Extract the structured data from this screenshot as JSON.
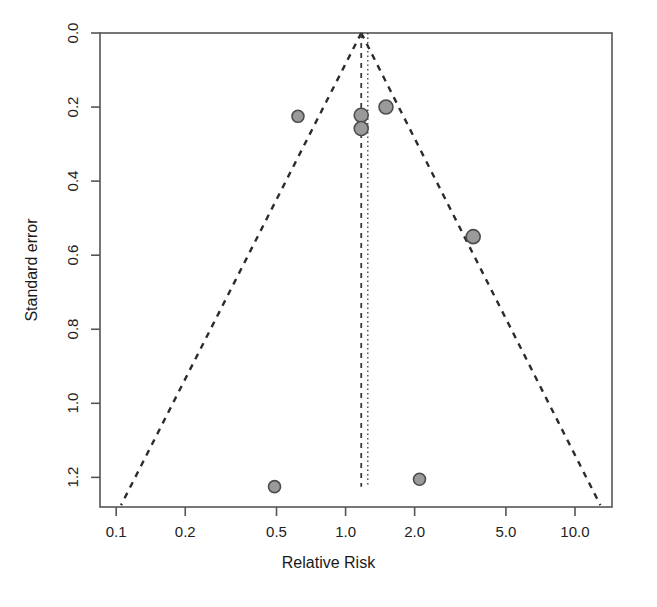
{
  "chart_data": {
    "type": "scatter",
    "title": "",
    "subtitle": "",
    "xlabel": "Relative Risk",
    "ylabel": "Standard error",
    "x_scale": "log",
    "y_scale": "linear",
    "y_inverted": true,
    "xlim": [
      0.085,
      14.5
    ],
    "ylim": [
      0.0,
      1.28
    ],
    "grid": false,
    "legend": null,
    "legend_position": "none",
    "x_ticks": [
      {
        "value": 0.1,
        "label": "0.1"
      },
      {
        "value": 0.2,
        "label": "0.2"
      },
      {
        "value": 0.5,
        "label": "0.5"
      },
      {
        "value": 1.0,
        "label": "1.0"
      },
      {
        "value": 2.0,
        "label": "2.0"
      },
      {
        "value": 5.0,
        "label": "5.0"
      },
      {
        "value": 10.0,
        "label": "10.0"
      }
    ],
    "y_ticks": [
      {
        "value": 0.0,
        "label": "0.0"
      },
      {
        "value": 0.2,
        "label": "0.2"
      },
      {
        "value": 0.4,
        "label": "0.4"
      },
      {
        "value": 0.6,
        "label": "0.6"
      },
      {
        "value": 0.8,
        "label": "0.8"
      },
      {
        "value": 1.0,
        "label": "1.0"
      },
      {
        "value": 1.2,
        "label": "1.2"
      }
    ],
    "points": [
      {
        "x": 0.62,
        "y": 0.225,
        "r": 6
      },
      {
        "x": 1.17,
        "y": 0.222,
        "r": 7
      },
      {
        "x": 1.17,
        "y": 0.258,
        "r": 7
      },
      {
        "x": 1.5,
        "y": 0.2,
        "r": 7
      },
      {
        "x": 3.6,
        "y": 0.55,
        "r": 7
      },
      {
        "x": 0.49,
        "y": 1.225,
        "r": 6
      },
      {
        "x": 2.1,
        "y": 1.205,
        "r": 6
      }
    ],
    "point_fill": "#9a9a9a",
    "point_stroke": "#4d4d4d",
    "reference_lines": [
      {
        "name": "null-effect-line",
        "x": 1.17,
        "style": "dashed",
        "color": "#3a3a3a"
      },
      {
        "name": "pooled-estimate-line",
        "x": 1.25,
        "style": "dotted",
        "color": "#3a3a3a"
      }
    ],
    "funnel": {
      "apex_x": 1.17,
      "apex_y": 0.0,
      "left_base_x": 0.105,
      "right_base_x": 12.9,
      "base_y": 1.275,
      "style": "dashed",
      "color": "#2b2b2b"
    },
    "axis_color": "#555555",
    "background": "#ffffff"
  }
}
